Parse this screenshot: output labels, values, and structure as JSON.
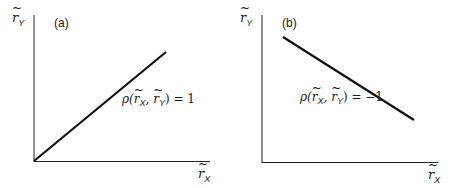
{
  "panels": [
    {
      "tag": "(a)",
      "y_axis_label": "r",
      "y_axis_sub": "Y",
      "x_axis_label": "r",
      "x_axis_sub": "X",
      "annotation_prefix": "ρ(",
      "annotation_r1": "r",
      "annotation_s1": "X",
      "annotation_mid": ", ",
      "annotation_r2": "r",
      "annotation_s2": "Y",
      "annotation_suffix": ") = 1",
      "correlation": 1
    },
    {
      "tag": "(b)",
      "y_axis_label": "r",
      "y_axis_sub": "Y",
      "x_axis_label": "r",
      "x_axis_sub": "X",
      "annotation_prefix": "ρ(",
      "annotation_r1": "r",
      "annotation_s1": "X",
      "annotation_mid": ", ",
      "annotation_r2": "r",
      "annotation_s2": "Y",
      "annotation_suffix": ") = −1",
      "correlation": -1
    }
  ]
}
